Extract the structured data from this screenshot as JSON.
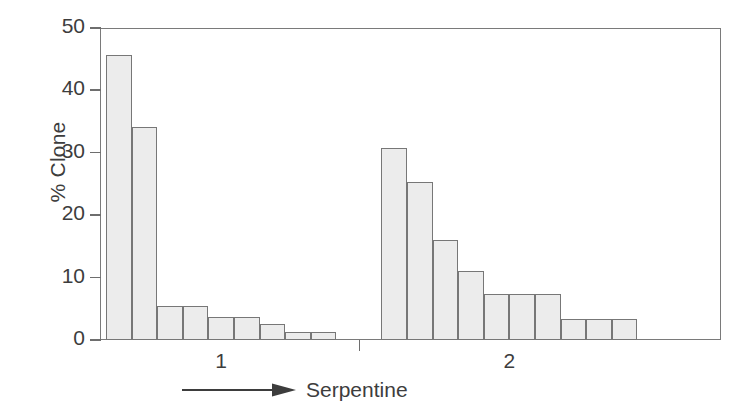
{
  "chart_data": {
    "type": "bar",
    "title": "",
    "subtitle": "",
    "xlabel": "Serpentine",
    "ylabel": "% Clone",
    "ylim": [
      0,
      50
    ],
    "yticks": [
      0,
      10,
      20,
      30,
      40,
      50
    ],
    "ytick_labels": [
      "0",
      "10",
      "20",
      "30",
      "40",
      "50"
    ],
    "xtick_labels": [
      "1",
      "2"
    ],
    "grid": false,
    "legend": null,
    "annotations": [
      "arrow pointing right beneath axis toward Serpentine label"
    ],
    "groups": [
      {
        "name": "1",
        "tick_label": "1",
        "values": [
          45.7,
          34.2,
          5.5,
          5.5,
          3.7,
          3.7,
          2.5,
          1.3,
          1.3
        ]
      },
      {
        "name": "2",
        "tick_label": "2",
        "values": [
          30.7,
          25.4,
          16.1,
          11.1,
          7.3,
          7.3,
          7.3,
          3.4,
          3.4,
          3.4
        ]
      }
    ],
    "categories": [
      "1-a",
      "1-b",
      "1-c",
      "1-d",
      "1-e",
      "1-f",
      "1-g",
      "1-h",
      "1-i",
      "2-a",
      "2-b",
      "2-c",
      "2-d",
      "2-e",
      "2-f",
      "2-g",
      "2-h",
      "2-i",
      "2-j"
    ],
    "values": [
      45.7,
      34.2,
      5.5,
      5.5,
      3.7,
      3.7,
      2.5,
      1.3,
      1.3,
      30.7,
      25.4,
      16.1,
      11.1,
      7.3,
      7.3,
      7.3,
      3.4,
      3.4,
      3.4
    ],
    "bar_fill_color": "#ececec",
    "bar_edge_color": "#777777",
    "axis_color": "#7a7a7a",
    "text_color": "#3d3d3d",
    "background_color": "#ffffff"
  },
  "axis": {
    "y_title": "% Clone",
    "x_caption": "Serpentine"
  }
}
